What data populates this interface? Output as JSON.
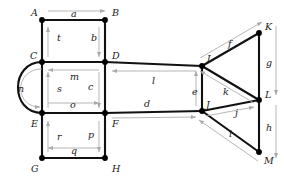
{
  "diagram": {
    "colors": {
      "edge": "#111111",
      "direction_arrow": "#a9a9a9",
      "node": "#000000",
      "background": "#ffffff",
      "text": "#1a1a1a"
    },
    "nodes": [
      {
        "id": "A",
        "label": "A",
        "x": 42,
        "y": 20,
        "label_x": 31,
        "label_y": 16
      },
      {
        "id": "B",
        "label": "B",
        "x": 105,
        "y": 20,
        "label_x": 112,
        "label_y": 16
      },
      {
        "id": "C",
        "label": "C",
        "x": 42,
        "y": 62,
        "label_x": 30,
        "label_y": 59
      },
      {
        "id": "D",
        "label": "D",
        "x": 105,
        "y": 62,
        "label_x": 112,
        "label_y": 59
      },
      {
        "id": "E",
        "label": "E",
        "x": 42,
        "y": 113,
        "label_x": 31,
        "label_y": 127
      },
      {
        "id": "F",
        "label": "F",
        "x": 105,
        "y": 113,
        "label_x": 112,
        "label_y": 127
      },
      {
        "id": "G",
        "label": "G",
        "x": 42,
        "y": 158,
        "label_x": 31,
        "label_y": 172
      },
      {
        "id": "H",
        "label": "H",
        "x": 105,
        "y": 158,
        "label_x": 112,
        "label_y": 172
      },
      {
        "id": "I",
        "label": "I",
        "x": 202,
        "y": 66,
        "label_x": 207,
        "label_y": 62
      },
      {
        "id": "J",
        "label": "J",
        "x": 202,
        "y": 111,
        "label_x": 206,
        "label_y": 108
      },
      {
        "id": "K",
        "label": "K",
        "x": 259,
        "y": 33,
        "label_x": 265,
        "label_y": 30
      },
      {
        "id": "L",
        "label": "L",
        "x": 259,
        "y": 100,
        "label_x": 265,
        "label_y": 98
      },
      {
        "id": "M",
        "label": "M",
        "x": 259,
        "y": 152,
        "label_x": 264,
        "label_y": 164
      }
    ],
    "edges": [
      {
        "id": "a",
        "label": "a",
        "from": "A",
        "to": "B",
        "label_x": 71,
        "label_y": 17
      },
      {
        "id": "b",
        "label": "b",
        "from": "B",
        "to": "D",
        "label_x": 91,
        "label_y": 41
      },
      {
        "id": "t",
        "label": "t",
        "from": "C",
        "to": "A",
        "label_x": 57,
        "label_y": 41
      },
      {
        "id": "m",
        "label": "m",
        "from": "D",
        "to": "C",
        "label_x": 70,
        "label_y": 80
      },
      {
        "id": "c",
        "label": "c",
        "from": "D",
        "to": "F",
        "label_x": 88,
        "label_y": 90
      },
      {
        "id": "s",
        "label": "s",
        "from": "E",
        "to": "C",
        "label_x": 57,
        "label_y": 92
      },
      {
        "id": "o",
        "label": "o",
        "from": "E",
        "to": "F",
        "label_x": 70,
        "label_y": 108
      },
      {
        "id": "n",
        "label": "n",
        "from": "C",
        "to": "E",
        "label_x": 18,
        "label_y": 92
      },
      {
        "id": "r",
        "label": "r",
        "from": "G",
        "to": "E",
        "label_x": 57,
        "label_y": 140
      },
      {
        "id": "p",
        "label": "p",
        "from": "F",
        "to": "H",
        "label_x": 88,
        "label_y": 138
      },
      {
        "id": "q",
        "label": "q",
        "from": "H",
        "to": "G",
        "label_x": 71,
        "label_y": 154
      },
      {
        "id": "l",
        "label": "l",
        "from": "I",
        "to": "D",
        "label_x": 152,
        "label_y": 84
      },
      {
        "id": "d",
        "label": "d",
        "from": "F",
        "to": "J",
        "label_x": 144,
        "label_y": 107
      },
      {
        "id": "e",
        "label": "e",
        "from": "J",
        "to": "I",
        "label_x": 192,
        "label_y": 95
      },
      {
        "id": "f",
        "label": "f",
        "from": "I",
        "to": "K",
        "label_x": 228,
        "label_y": 47
      },
      {
        "id": "g",
        "label": "g",
        "from": "K",
        "to": "L",
        "label_x": 266,
        "label_y": 66
      },
      {
        "id": "k",
        "label": "k",
        "from": "L",
        "to": "I",
        "label_x": 223,
        "label_y": 95
      },
      {
        "id": "j",
        "label": "j",
        "from": "J",
        "to": "L",
        "label_x": 235,
        "label_y": 116
      },
      {
        "id": "h",
        "label": "h",
        "from": "L",
        "to": "M",
        "label_x": 266,
        "label_y": 131
      },
      {
        "id": "i",
        "label": "i",
        "from": "M",
        "to": "J",
        "label_x": 229,
        "label_y": 137
      }
    ]
  }
}
